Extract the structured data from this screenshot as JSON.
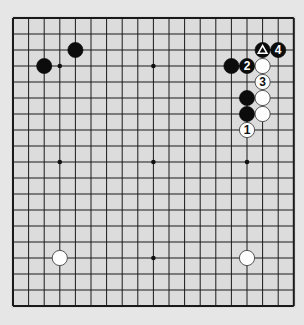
{
  "board": {
    "size": 19,
    "origin_x": 13,
    "origin_y": 18,
    "spacing_x": 15.6,
    "spacing_y": 16.0,
    "background": "#dcdcdc",
    "line_color": "#1a1a1a",
    "star_points": [
      [
        3,
        3
      ],
      [
        9,
        3
      ],
      [
        15,
        3
      ],
      [
        3,
        9
      ],
      [
        9,
        9
      ],
      [
        15,
        9
      ],
      [
        3,
        15
      ],
      [
        9,
        15
      ],
      [
        15,
        15
      ]
    ]
  },
  "stones": [
    {
      "color": "black",
      "col": 2,
      "row": 3,
      "label": ""
    },
    {
      "color": "black",
      "col": 4,
      "row": 2,
      "label": ""
    },
    {
      "color": "black",
      "col": 16,
      "row": 2,
      "label": "△",
      "marker": "triangle"
    },
    {
      "color": "black",
      "col": 17,
      "row": 2,
      "label": "4"
    },
    {
      "color": "black",
      "col": 14,
      "row": 3,
      "label": ""
    },
    {
      "color": "black",
      "col": 15,
      "row": 3,
      "label": "2"
    },
    {
      "color": "white",
      "col": 16,
      "row": 3,
      "label": ""
    },
    {
      "color": "white",
      "col": 16,
      "row": 4,
      "label": "3"
    },
    {
      "color": "black",
      "col": 15,
      "row": 5,
      "label": ""
    },
    {
      "color": "white",
      "col": 16,
      "row": 5,
      "label": ""
    },
    {
      "color": "black",
      "col": 15,
      "row": 6,
      "label": ""
    },
    {
      "color": "white",
      "col": 16,
      "row": 6,
      "label": ""
    },
    {
      "color": "white",
      "col": 15,
      "row": 7,
      "label": "1"
    },
    {
      "color": "white",
      "col": 3,
      "row": 15,
      "label": ""
    },
    {
      "color": "white",
      "col": 15,
      "row": 15,
      "label": ""
    }
  ]
}
